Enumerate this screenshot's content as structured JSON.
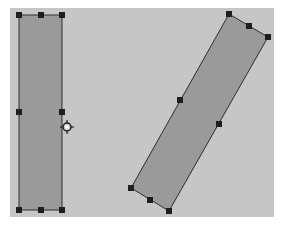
{
  "canvas": {
    "background": "#c6c6c6",
    "x": 10,
    "y": 8,
    "width": 264,
    "height": 209
  },
  "shapes": [
    {
      "name": "upright-rectangle",
      "selected": true,
      "fill": "#9a9a9a",
      "stroke": "#2e2e2e",
      "points": [
        [
          19,
          15
        ],
        [
          62,
          15
        ],
        [
          62,
          210
        ],
        [
          19,
          210
        ]
      ],
      "handles": [
        [
          19,
          15
        ],
        [
          41,
          15
        ],
        [
          62,
          15
        ],
        [
          19,
          112
        ],
        [
          62,
          112
        ],
        [
          19,
          210
        ],
        [
          41,
          210
        ],
        [
          62,
          210
        ]
      ]
    },
    {
      "name": "rotated-rectangle",
      "selected": true,
      "fill": "#9a9a9a",
      "stroke": "#2e2e2e",
      "points": [
        [
          229,
          14
        ],
        [
          268,
          37
        ],
        [
          169,
          211
        ],
        [
          131,
          188
        ]
      ],
      "handles": [
        [
          229,
          14
        ],
        [
          249,
          26
        ],
        [
          268,
          37
        ],
        [
          180,
          100
        ],
        [
          219,
          124
        ],
        [
          131,
          188
        ],
        [
          150,
          200
        ],
        [
          169,
          211
        ]
      ]
    }
  ],
  "cursor": {
    "type": "rotate-cursor",
    "x": 67,
    "y": 127
  }
}
